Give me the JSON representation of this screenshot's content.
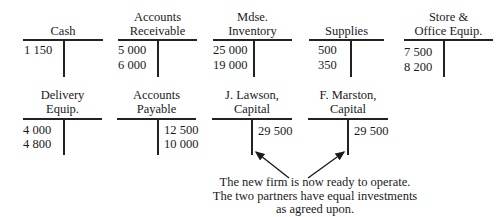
{
  "row1": [
    {
      "title": [
        "",
        "Cash"
      ],
      "debits": [
        "1 150"
      ],
      "credits": []
    },
    {
      "title": [
        "Accounts",
        "Receivable"
      ],
      "debits": [
        "5 000",
        "6 000"
      ],
      "credits": []
    },
    {
      "title": [
        "Mdse.",
        "Inventory"
      ],
      "debits": [
        "25 000",
        "19 000"
      ],
      "credits": []
    },
    {
      "title": [
        "",
        "Supplies"
      ],
      "debits": [
        "500",
        "350"
      ],
      "credits": []
    },
    {
      "title": [
        "Store &",
        "Office Equip."
      ],
      "debits": [
        "7 500",
        "8 200"
      ],
      "credits": []
    }
  ],
  "row2": [
    {
      "title": [
        "Delivery",
        "Equip."
      ],
      "debits": [
        "4 000",
        "4 800"
      ],
      "credits": []
    },
    {
      "title": [
        "Accounts",
        "Payable"
      ],
      "debits": [],
      "credits": [
        "12 500",
        "10 000"
      ]
    },
    {
      "title": [
        "J. Lawson,",
        "Capital"
      ],
      "debits": [],
      "credits": [
        "29 500"
      ]
    },
    {
      "title": [
        "F. Marston,",
        "Capital"
      ],
      "debits": [],
      "credits": [
        "29 500"
      ]
    }
  ],
  "note": {
    "line1": "The new firm is now ready to operate.",
    "line2": "The two partners have equal investments",
    "line3": "as agreed upon."
  }
}
